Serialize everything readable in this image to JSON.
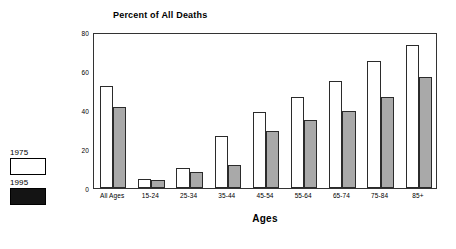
{
  "chart_data": {
    "type": "bar",
    "title": "Percent of All Deaths",
    "xlabel": "Ages",
    "ylabel": "",
    "ylim": [
      0,
      80
    ],
    "yticks": [
      0,
      20,
      40,
      60,
      80
    ],
    "grid": false,
    "legend_position": "left-outside",
    "categories": [
      "All Ages",
      "15-24",
      "25-34",
      "35-44",
      "45-54",
      "55-64",
      "65-74",
      "75-84",
      "85+"
    ],
    "series": [
      {
        "name": "1975",
        "color": "#ffffff",
        "values": [
          52.5,
          4.5,
          10.5,
          26.5,
          39,
          46.5,
          55,
          65,
          73.5
        ]
      },
      {
        "name": "1995",
        "color": "#a9a9a9",
        "values": [
          41.5,
          4,
          8,
          12,
          29,
          35,
          39.5,
          46.5,
          57
        ]
      }
    ]
  },
  "legend": {
    "entries": [
      {
        "label": "1975",
        "swatch": "white-swatch"
      },
      {
        "label": "1995",
        "swatch": "dark-swatch"
      }
    ]
  }
}
